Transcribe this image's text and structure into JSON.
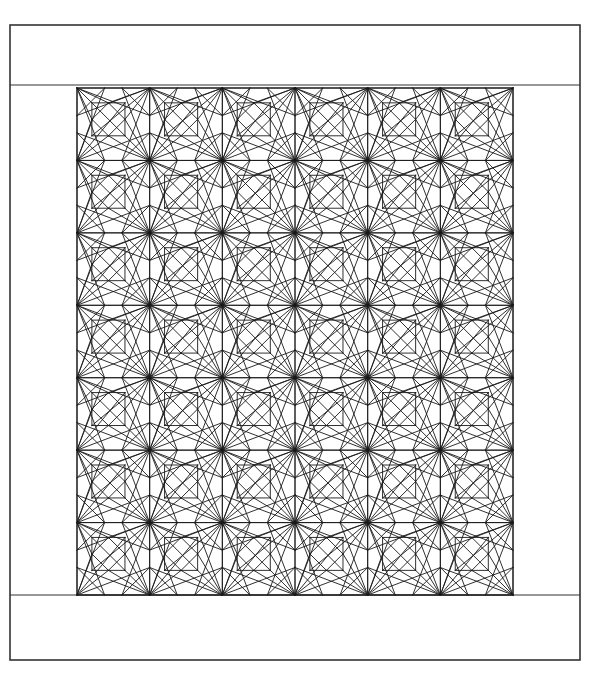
{
  "document": {
    "kind": "quilt-pattern-diagram",
    "title_partial": "QUILT PATTERN",
    "background_color": "#ffffff",
    "line_color": "#1a1a1a",
    "frame_color": "#333333"
  },
  "canvas": {
    "width": 591,
    "height": 675
  },
  "outer_frame": {
    "label": "outer-border",
    "x": 10,
    "y": 25,
    "width": 570,
    "height": 635,
    "stroke_width": 1.6
  },
  "inner_border": {
    "label": "inner-sashing-border",
    "x": 10,
    "y": 85,
    "width": 570,
    "height": 510,
    "stroke_width": 1.2
  },
  "quilt_field": {
    "label": "pieced-block-field",
    "x": 77,
    "y": 88,
    "width": 436,
    "height": 507,
    "columns": 6,
    "rows": 7,
    "block_count": 42,
    "block_width": 72.67,
    "block_height": 72.43,
    "stroke_width": 0.9
  },
  "block_geometry": {
    "name": "storm-at-sea-block",
    "description": "Unit square block: outer square frame, corner-to-corner and edge-midpoint diagonals, a centred square with an inscribed rotated diamond.",
    "unit": 1.0,
    "center_square": {
      "x0": 0.205,
      "y0": 0.205,
      "x1": 0.66,
      "y1": 0.66
    },
    "segments": [
      [
        0.0,
        0.0,
        1.0,
        0.0
      ],
      [
        1.0,
        0.0,
        1.0,
        1.0
      ],
      [
        1.0,
        1.0,
        0.0,
        1.0
      ],
      [
        0.0,
        1.0,
        0.0,
        0.0
      ],
      [
        0.205,
        0.205,
        0.66,
        0.205
      ],
      [
        0.66,
        0.205,
        0.66,
        0.66
      ],
      [
        0.66,
        0.66,
        0.205,
        0.66
      ],
      [
        0.205,
        0.66,
        0.205,
        0.205
      ],
      [
        0.4325,
        0.205,
        0.66,
        0.4325
      ],
      [
        0.66,
        0.4325,
        0.4325,
        0.66
      ],
      [
        0.4325,
        0.66,
        0.205,
        0.4325
      ],
      [
        0.205,
        0.4325,
        0.4325,
        0.205
      ],
      [
        0.0,
        0.0,
        0.66,
        0.66
      ],
      [
        0.66,
        0.66,
        1.0,
        1.0
      ],
      [
        1.0,
        0.0,
        0.205,
        0.66
      ],
      [
        0.0,
        1.0,
        0.66,
        0.205
      ],
      [
        0.0,
        0.0,
        0.205,
        0.4325
      ],
      [
        0.0,
        0.0,
        0.4325,
        0.205
      ],
      [
        1.0,
        0.0,
        0.66,
        0.4325
      ],
      [
        1.0,
        0.0,
        0.4325,
        0.205
      ],
      [
        0.0,
        1.0,
        0.205,
        0.4325
      ],
      [
        0.0,
        1.0,
        0.4325,
        0.66
      ],
      [
        1.0,
        1.0,
        0.66,
        0.4325
      ],
      [
        1.0,
        1.0,
        0.4325,
        0.66
      ],
      [
        0.0,
        0.0,
        1.0,
        0.38
      ],
      [
        1.0,
        0.0,
        0.0,
        0.38
      ],
      [
        0.0,
        1.0,
        1.0,
        0.62
      ],
      [
        1.0,
        1.0,
        0.0,
        0.62
      ],
      [
        0.0,
        0.0,
        0.38,
        1.0
      ],
      [
        0.0,
        1.0,
        0.38,
        0.0
      ],
      [
        1.0,
        0.0,
        0.62,
        1.0
      ],
      [
        1.0,
        1.0,
        0.62,
        0.0
      ],
      [
        0.0,
        0.38,
        0.38,
        0.0
      ],
      [
        1.0,
        0.38,
        0.62,
        0.0
      ],
      [
        0.0,
        0.62,
        0.38,
        1.0
      ],
      [
        1.0,
        0.62,
        0.62,
        1.0
      ]
    ]
  },
  "legend": {
    "rows_label": "7",
    "cols_label": "6"
  }
}
